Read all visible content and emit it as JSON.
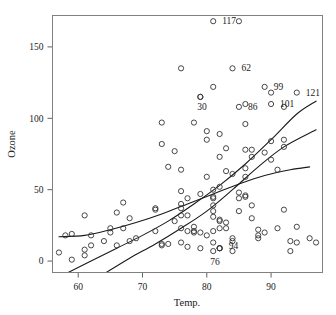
{
  "chart_data": {
    "type": "scatter",
    "title": "",
    "xlabel": "Temp.",
    "ylabel": "Ozone",
    "xlim": [
      56.0,
      98.0
    ],
    "ylim": [
      -8.0,
      172.0
    ],
    "xticks": [
      60,
      70,
      80,
      90
    ],
    "yticks": [
      0,
      50,
      100,
      150
    ],
    "xtick_labels": [
      "60",
      "70",
      "80",
      "90"
    ],
    "ytick_labels": [
      "0",
      "50",
      "100",
      "150"
    ],
    "grid": false,
    "legend": "none",
    "marker": "open-circle",
    "point_color": "#333333",
    "curve_color": "#1a1a1a",
    "frame_color": "#808080",
    "points": [
      [
        67,
        41
      ],
      [
        72,
        36
      ],
      [
        74,
        12
      ],
      [
        62,
        18
      ],
      [
        65,
        23
      ],
      [
        59,
        19
      ],
      [
        61,
        8
      ],
      [
        69,
        16
      ],
      [
        66,
        11
      ],
      [
        68,
        14
      ],
      [
        58,
        18
      ],
      [
        64,
        14
      ],
      [
        66,
        34
      ],
      [
        57,
        6
      ],
      [
        68,
        30
      ],
      [
        62,
        11
      ],
      [
        59,
        1
      ],
      [
        73,
        11
      ],
      [
        61,
        4
      ],
      [
        61,
        32
      ],
      [
        67,
        23
      ],
      [
        81,
        45
      ],
      [
        79,
        115
      ],
      [
        76,
        37
      ],
      [
        82,
        29
      ],
      [
        90,
        71
      ],
      [
        87,
        39
      ],
      [
        82,
        23
      ],
      [
        77,
        21
      ],
      [
        72,
        37
      ],
      [
        65,
        20
      ],
      [
        73,
        12
      ],
      [
        76,
        13
      ],
      [
        76,
        135
      ],
      [
        76,
        49
      ],
      [
        76,
        32
      ],
      [
        76,
        64
      ],
      [
        76,
        40
      ],
      [
        75,
        77
      ],
      [
        78,
        97
      ],
      [
        73,
        97
      ],
      [
        80,
        85
      ],
      [
        77,
        10
      ],
      [
        83,
        27
      ],
      [
        84,
        7
      ],
      [
        85,
        48
      ],
      [
        81,
        35
      ],
      [
        84,
        61
      ],
      [
        83,
        79
      ],
      [
        83,
        63
      ],
      [
        88,
        16
      ],
      [
        92,
        80
      ],
      [
        92,
        108
      ],
      [
        89,
        20
      ],
      [
        82,
        52
      ],
      [
        73,
        82
      ],
      [
        81,
        50
      ],
      [
        91,
        64
      ],
      [
        80,
        59
      ],
      [
        81,
        39
      ],
      [
        82,
        9
      ],
      [
        84,
        16
      ],
      [
        87,
        78
      ],
      [
        85,
        35
      ],
      [
        74,
        66
      ],
      [
        81,
        122
      ],
      [
        82,
        89
      ],
      [
        86,
        110
      ],
      [
        85,
        44
      ],
      [
        82,
        28
      ],
      [
        86,
        65
      ],
      [
        88,
        22
      ],
      [
        86,
        59
      ],
      [
        83,
        23
      ],
      [
        81,
        31
      ],
      [
        81,
        44
      ],
      [
        81,
        21
      ],
      [
        82,
        9
      ],
      [
        86,
        45
      ],
      [
        85,
        168
      ],
      [
        87,
        73
      ],
      [
        89,
        76
      ],
      [
        90,
        118
      ],
      [
        90,
        84
      ],
      [
        92,
        85
      ],
      [
        86,
        96
      ],
      [
        86,
        78
      ],
      [
        82,
        73
      ],
      [
        80,
        91
      ],
      [
        79,
        47
      ],
      [
        77,
        32
      ],
      [
        79,
        20
      ],
      [
        76,
        23
      ],
      [
        78,
        21
      ],
      [
        78,
        24
      ],
      [
        77,
        44
      ],
      [
        72,
        21
      ],
      [
        75,
        28
      ],
      [
        79,
        9
      ],
      [
        81,
        13
      ],
      [
        86,
        46
      ],
      [
        88,
        18
      ],
      [
        97,
        13
      ],
      [
        94,
        24
      ],
      [
        96,
        16
      ],
      [
        94,
        13
      ],
      [
        91,
        23
      ],
      [
        92,
        36
      ],
      [
        93,
        7
      ],
      [
        93,
        14
      ],
      [
        87,
        30
      ],
      [
        84,
        14
      ],
      [
        80,
        18
      ],
      [
        78,
        20
      ]
    ],
    "labeled_points": [
      {
        "id": "117",
        "x": 81,
        "y": 168,
        "label_dx": 9,
        "label_dy": 3
      },
      {
        "id": "62",
        "x": 84,
        "y": 135,
        "label_dx": 9,
        "label_dy": 3
      },
      {
        "id": "99",
        "x": 89,
        "y": 122,
        "label_dx": 9,
        "label_dy": 3
      },
      {
        "id": "121",
        "x": 94,
        "y": 118,
        "label_dx": 9,
        "label_dy": 3
      },
      {
        "id": "101",
        "x": 90,
        "y": 110,
        "label_dx": 9,
        "label_dy": 3
      },
      {
        "id": "86",
        "x": 85,
        "y": 108,
        "label_dx": 9,
        "label_dy": 3
      },
      {
        "id": "30",
        "x": 79,
        "y": 115,
        "label_dx": -3,
        "label_dy": 13
      },
      {
        "id": "94",
        "x": 82,
        "y": 9,
        "label_dx": 9,
        "label_dy": 1
      },
      {
        "id": "76",
        "x": 81,
        "y": 7,
        "label_dx": -3,
        "label_dy": 14
      }
    ],
    "curves": [
      {
        "name": "upper-fit",
        "description": "steep fitted curve rising to upper right",
        "x": [
          58,
          62,
          66,
          70,
          74,
          78,
          82,
          86,
          90,
          94,
          97
        ],
        "y": [
          -9,
          0,
          9,
          18,
          28,
          40,
          53,
          68,
          85,
          103,
          112
        ]
      },
      {
        "name": "middle-fit",
        "description": "near-linear fitted curve through the bulk of points",
        "x": [
          64,
          68,
          72,
          76,
          80,
          84,
          88,
          92,
          97
        ],
        "y": [
          -9,
          2,
          12,
          23,
          35,
          50,
          66,
          80,
          92
        ]
      },
      {
        "name": "lower-fit",
        "description": "flattening loess-style curve starting near left edge",
        "x": [
          57,
          61,
          65,
          69,
          73,
          77,
          81,
          85,
          89,
          93,
          96
        ],
        "y": [
          17,
          18,
          22,
          27,
          33,
          40,
          47,
          54,
          60,
          64,
          66
        ]
      }
    ]
  }
}
